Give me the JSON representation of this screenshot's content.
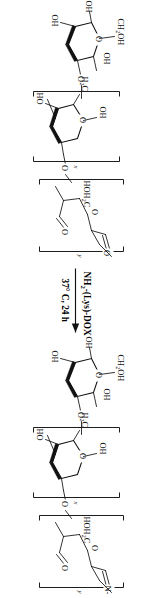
{
  "figure": {
    "kind": "chemical-reaction-scheme",
    "orientation_degrees": 90,
    "background_color": "#ffffff",
    "line_color": "#111111"
  },
  "reaction": {
    "arrow": {
      "name": "reaction-arrow",
      "direction": "left-to-right"
    },
    "reagent_above": {
      "pre": "NH",
      "sub": "2",
      "post": "-(Lys)-DOX"
    },
    "conditions_below": {
      "text": "37° C, 24 h"
    }
  },
  "reactant": {
    "name": "oxidized-dextran",
    "polymer_blocks": [
      {
        "label": "x",
        "type": "intact-glucopyranose-unit"
      },
      {
        "label": "y",
        "type": "dialdehyde-ring-opened-unit"
      }
    ],
    "labels": [
      {
        "id": "r-ch2oh-terminal",
        "text": "CH",
        "sub": "2",
        "post": "OH"
      },
      {
        "id": "r-oh-terminal-1",
        "text": "OH"
      },
      {
        "id": "r-oh-terminal-2",
        "text": "OH"
      },
      {
        "id": "r-o-glycosidic-1",
        "text": "O"
      },
      {
        "id": "r-ring-o-1",
        "text": "O"
      },
      {
        "id": "r-oh-ring-1",
        "text": "OH"
      },
      {
        "id": "r-oh-ring-2",
        "text": "OH"
      },
      {
        "id": "r-ho-ring",
        "text": "HO"
      },
      {
        "id": "r-h2c",
        "text": "H",
        "sub": "2",
        "post": "C"
      },
      {
        "id": "r-o-glycosidic-2",
        "text": "O"
      },
      {
        "id": "r-hoh2c",
        "text": "HOH",
        "sub": "2",
        "post": "C"
      },
      {
        "id": "r-aldehyde-o-1",
        "text": "O"
      },
      {
        "id": "r-aldehyde-o-2",
        "text": "O"
      },
      {
        "id": "r-ring-o-2",
        "text": "O"
      },
      {
        "id": "r-o-link",
        "text": "O"
      }
    ]
  },
  "product": {
    "name": "dextran-imine-dox-conjugate",
    "polymer_blocks": [
      {
        "label": "x",
        "type": "intact-glucopyranose-unit"
      },
      {
        "label": "y",
        "type": "imine-bearing-unit"
      }
    ],
    "labels": [
      {
        "id": "p-ch2oh-terminal",
        "text": "CH",
        "sub": "2",
        "post": "OH"
      },
      {
        "id": "p-oh-terminal-1",
        "text": "OH"
      },
      {
        "id": "p-oh-terminal-2",
        "text": "OH"
      },
      {
        "id": "p-o-glycosidic-1",
        "text": "O"
      },
      {
        "id": "p-ring-o-1",
        "text": "O"
      },
      {
        "id": "p-oh-ring-1",
        "text": "OH"
      },
      {
        "id": "p-oh-ring-2",
        "text": "OH"
      },
      {
        "id": "p-ho-ring",
        "text": "HO"
      },
      {
        "id": "p-h2c",
        "text": "H",
        "sub": "2",
        "post": "C"
      },
      {
        "id": "p-o-glycosidic-2",
        "text": "O"
      },
      {
        "id": "p-hoh2c",
        "text": "HOH",
        "sub": "2",
        "post": "C"
      },
      {
        "id": "p-aldehyde-o",
        "text": "O"
      },
      {
        "id": "p-ring-o-2",
        "text": "O"
      },
      {
        "id": "p-imine-n",
        "text": "N-"
      },
      {
        "id": "p-o-link",
        "text": "O"
      }
    ]
  }
}
